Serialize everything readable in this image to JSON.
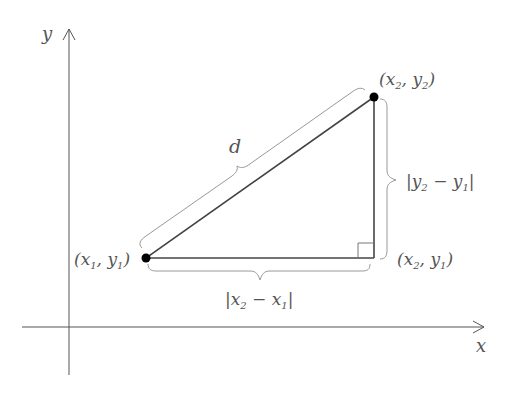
{
  "diagram": {
    "axes": {
      "x_label": "x",
      "y_label": "y"
    },
    "points": [
      {
        "id": "p1",
        "label_open": "(",
        "var1": "x",
        "sub1": "1",
        "var2": "y",
        "sub2": "1",
        "close": ")"
      },
      {
        "id": "p2",
        "label_open": "(",
        "var1": "x",
        "sub1": "2",
        "var2": "y",
        "sub2": "2",
        "close": ")"
      },
      {
        "id": "corner",
        "label_open": "(",
        "var1": "x",
        "sub1": "2",
        "var2": "y",
        "sub2": "1",
        "close": ")"
      }
    ],
    "hypotenuse_label": "d",
    "horizontal_label": {
      "a": "x",
      "a_sub": "2",
      "op": "−",
      "b": "x",
      "b_sub": "1"
    },
    "vertical_label": {
      "a": "y",
      "a_sub": "2",
      "op": "−",
      "b": "y",
      "b_sub": "1"
    },
    "colors": {
      "axis": "#555555",
      "line": "#444444",
      "brace": "#999999",
      "point": "#000000",
      "text": "#555555"
    }
  }
}
